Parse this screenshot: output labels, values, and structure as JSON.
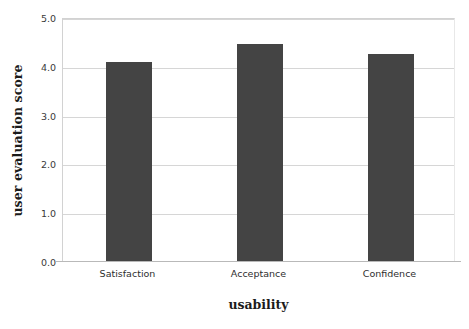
{
  "chart_data": {
    "type": "bar",
    "title": "",
    "xlabel": "usability",
    "ylabel": "user evaluation score",
    "categories": [
      "Satisfaction",
      "Acceptance",
      "Confidence"
    ],
    "values": [
      4.1,
      4.46,
      4.27
    ],
    "series": [
      {
        "name": "user evaluation score",
        "values": [
          4.1,
          4.46,
          4.27
        ]
      }
    ],
    "ylim": [
      0.0,
      5.0
    ],
    "ytick_labels": [
      "0.0",
      "1.0",
      "2.0",
      "3.0",
      "4.0",
      "5.0"
    ],
    "ytick_values": [
      0.0,
      1.0,
      2.0,
      3.0,
      4.0,
      5.0
    ],
    "grid": true,
    "legend": "none",
    "bar_color": "#444444",
    "gridline_color": "#d6d6d6",
    "background_color": "#ffffff"
  }
}
